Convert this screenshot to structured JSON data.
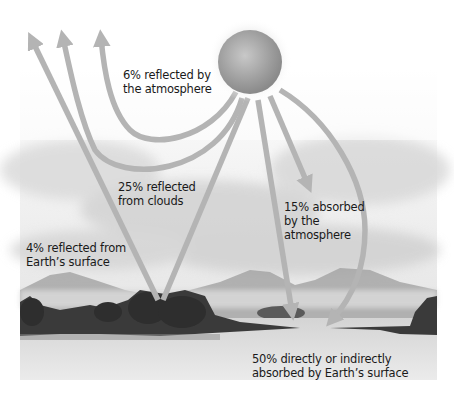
{
  "diagram": {
    "sun": {
      "icon": "sun-icon"
    },
    "labels": {
      "atmosphere_reflected": {
        "line1": "6% reflected by",
        "line2": "the atmosphere"
      },
      "clouds_reflected": {
        "line1": "25% reflected",
        "line2": "from clouds"
      },
      "surface_reflected": {
        "line1": "4% reflected from",
        "line2": "Earth’s surface"
      },
      "atmosphere_absorbed": {
        "line1": "15% absorbed",
        "line2": "by the",
        "line3": "atmosphere"
      },
      "surface_absorbed": {
        "line1": "50% directly or indirectly",
        "line2": "absorbed by Earth’s surface"
      }
    },
    "flows": [
      {
        "name": "reflected-by-atmosphere",
        "percent": 6
      },
      {
        "name": "reflected-from-clouds",
        "percent": 25
      },
      {
        "name": "reflected-from-surface",
        "percent": 4
      },
      {
        "name": "absorbed-by-atmosphere",
        "percent": 15
      },
      {
        "name": "absorbed-by-surface",
        "percent": 50
      }
    ],
    "colors": {
      "arrow": "#b4b4b4",
      "sun": "#9a9a9a",
      "text": "#1a1a1a",
      "background": "#ffffff"
    }
  }
}
